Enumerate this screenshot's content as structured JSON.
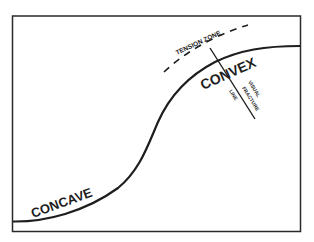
{
  "diagram": {
    "labels": {
      "concave": "CONCAVE",
      "convex": "CONVEX",
      "tension_zone": "TENSION ZONE",
      "fracture_line_1": "VISUAL",
      "fracture_line_2": "FRACTURE",
      "fracture_line_3": "LINE"
    },
    "colors": {
      "stroke": "#1e1e1e",
      "background": "#ffffff"
    }
  }
}
